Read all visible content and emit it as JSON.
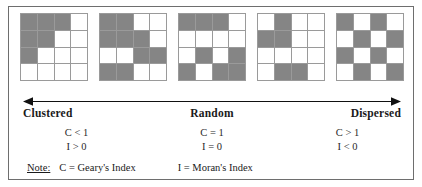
{
  "figure": {
    "fill_color": "#858585",
    "grid_line_color": "#9a9a9a",
    "frame_color": "#6e6e6e",
    "background": "#ffffff"
  },
  "grids": [
    {
      "name": "grid-clustered-1",
      "rows": [
        [
          1,
          1,
          1,
          0
        ],
        [
          1,
          1,
          0,
          0
        ],
        [
          1,
          0,
          0,
          0
        ],
        [
          0,
          0,
          0,
          0
        ]
      ]
    },
    {
      "name": "grid-clustered-2",
      "rows": [
        [
          1,
          1,
          0,
          0
        ],
        [
          1,
          1,
          1,
          0
        ],
        [
          0,
          0,
          1,
          1
        ],
        [
          1,
          1,
          0,
          0
        ]
      ]
    },
    {
      "name": "grid-random",
      "rows": [
        [
          1,
          1,
          1,
          0
        ],
        [
          0,
          0,
          0,
          0
        ],
        [
          0,
          1,
          0,
          1
        ],
        [
          1,
          0,
          1,
          1
        ]
      ]
    },
    {
      "name": "grid-dispersed-1",
      "rows": [
        [
          0,
          1,
          0,
          0
        ],
        [
          1,
          1,
          0,
          0
        ],
        [
          0,
          0,
          0,
          0
        ],
        [
          0,
          1,
          1,
          0
        ]
      ]
    },
    {
      "name": "grid-dispersed-2",
      "rows": [
        [
          1,
          0,
          1,
          0
        ],
        [
          0,
          1,
          0,
          1
        ],
        [
          1,
          0,
          1,
          0
        ],
        [
          0,
          1,
          0,
          1
        ]
      ]
    }
  ],
  "axis": {
    "name": "double-headed-arrow",
    "left_arrow": "left-arrowhead",
    "right_arrow": "right-arrowhead"
  },
  "labels": {
    "clustered": "Clustered",
    "random": "Random",
    "dispersed": "Dispersed"
  },
  "formulas": {
    "clustered": {
      "c": "C < 1",
      "i": "I > 0"
    },
    "random": {
      "c": "C = 1",
      "i": "I = 0"
    },
    "dispersed": {
      "c": "C > 1",
      "i": "I < 0"
    }
  },
  "note": {
    "label": "Note:",
    "geary": "C = Geary's Index",
    "moran": "I = Moran's Index"
  }
}
